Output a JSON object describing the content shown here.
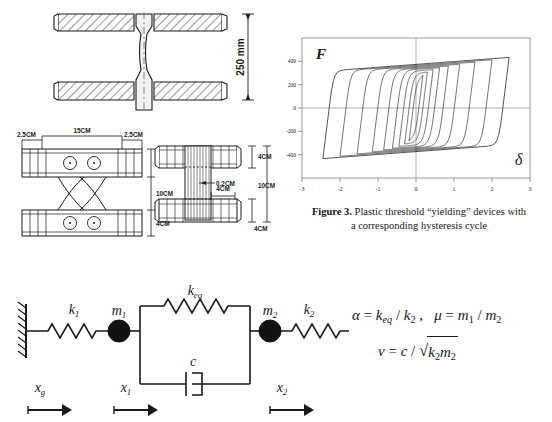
{
  "figure": {
    "caption_label": "Figure 3.",
    "caption_line1": " Plastic threshold “yielding” devices with",
    "caption_line2": "a corresponding hysteresis cycle"
  },
  "section_device": {
    "name": "yielding-device-section-view",
    "dimension_height": "250 mm"
  },
  "device_plan": {
    "dim_left": "2.5CM",
    "dim_mid": "15CM",
    "dim_right": "2.5CM",
    "dim_top_plate": "4CM",
    "dim_middle": "10CM",
    "dim_bottom_plate": "4CM"
  },
  "device_front": {
    "dim_plate_thickness": "0.2CM",
    "dim_core_width": "4CM",
    "dim_top_plate": "4CM",
    "dim_middle": "10CM",
    "dim_bottom_plate": "4CM"
  },
  "model": {
    "ground_label": "x",
    "ground_sub": "g",
    "mass1_label": "m",
    "mass1_sub": "1",
    "mass2_label": "m",
    "mass2_sub": "2",
    "spring1_label": "k",
    "spring1_sub": "1",
    "spring2_label": "k",
    "spring2_sub": "2",
    "spring_eq_label": "k",
    "spring_eq_sub": "eq",
    "damper_label": "c",
    "disp1_label": "x",
    "disp1_sub": "1",
    "disp2_label": "x",
    "disp2_sub": "2"
  },
  "equations": {
    "alpha": "α = k_eq / k₂",
    "mu": "μ = m₁ / m₂",
    "nu": "ν = c / √(k₂ m₂)"
  },
  "chart_data": {
    "type": "line",
    "title": "",
    "xlabel": "δ",
    "ylabel": "F",
    "xlim": [
      -3,
      3
    ],
    "ylim": [
      -600,
      600
    ],
    "xticks": [
      "-3",
      "-2",
      "-1",
      "0",
      "1",
      "2",
      "3"
    ],
    "yticks": [
      "400",
      "200",
      "0",
      "-200",
      "-400"
    ],
    "ytick_values": [
      400,
      200,
      0,
      -200,
      -400
    ],
    "grid": true,
    "legend": "none",
    "series": [
      {
        "name": "loop-1",
        "amplitude": 0.18,
        "force": 330
      },
      {
        "name": "loop-2",
        "amplitude": 0.3,
        "force": 360
      },
      {
        "name": "loop-3",
        "amplitude": 0.45,
        "force": 380
      },
      {
        "name": "loop-4",
        "amplitude": 0.62,
        "force": 395
      },
      {
        "name": "loop-5",
        "amplitude": 0.85,
        "force": 405
      },
      {
        "name": "loop-6",
        "amplitude": 1.15,
        "force": 415
      },
      {
        "name": "loop-7",
        "amplitude": 1.55,
        "force": 425
      },
      {
        "name": "loop-8",
        "amplitude": 2.0,
        "force": 435
      },
      {
        "name": "loop-9",
        "amplitude": 2.45,
        "force": 445
      }
    ]
  }
}
